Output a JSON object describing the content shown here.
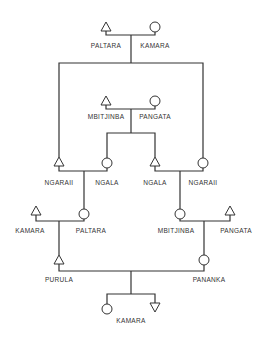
{
  "diagram": {
    "type": "kinship-chart",
    "symbols": {
      "male": "triangle",
      "female": "circle",
      "ego_male": "inverted-triangle"
    },
    "generations": [
      {
        "level": 1,
        "couple": {
          "husband": "PALTARA",
          "wife": "KAMARA"
        }
      },
      {
        "level": 2,
        "couple": {
          "husband": "MBITJINBA",
          "wife": "PANGATA"
        }
      },
      {
        "level": 3,
        "couples": [
          {
            "husband": "NGARAII",
            "wife": "NGALA"
          },
          {
            "husband": "NGALA",
            "wife": "NGARAII"
          }
        ]
      },
      {
        "level": 4,
        "couples": [
          {
            "husband": "KAMARA",
            "wife": "PALTARA"
          },
          {
            "husband": "PANGATA",
            "wife": "MBITJINBA"
          }
        ]
      },
      {
        "level": 5,
        "couple": {
          "husband": "PURULA",
          "wife": "PANANKA"
        }
      },
      {
        "level": 6,
        "children": {
          "label": "KAMARA",
          "female": "circle",
          "male": "inverted-triangle"
        }
      }
    ],
    "labels": {
      "g1_male": "PALTARA",
      "g1_female": "KAMARA",
      "g2_male": "MBITJINBA",
      "g2_female": "PANGATA",
      "g3_left_male": "NGARAII",
      "g3_left_female": "NGALA",
      "g3_right_male": "NGALA",
      "g3_right_female": "NGARAII",
      "g4_left_male": "KAMARA",
      "g4_left_female": "PALTARA",
      "g4_right_female": "MBITJINBA",
      "g4_right_male": "PANGATA",
      "g5_male": "PURULA",
      "g5_female": "PANANKA",
      "g6_children": "KAMARA"
    }
  }
}
